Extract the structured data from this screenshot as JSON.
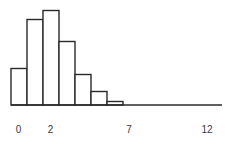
{
  "chart_data": {
    "type": "bar",
    "title": "",
    "subtitle": "",
    "xlabel": "",
    "ylabel": "",
    "grid": false,
    "legend": null,
    "bin_width": 1,
    "bin_edges": [
      0,
      1,
      2,
      3,
      4,
      5,
      6,
      7,
      12
    ],
    "categories": [
      "0-1",
      "1-2",
      "2-3",
      "3-4",
      "4-5",
      "5-6",
      "6-7"
    ],
    "values": [
      36,
      85,
      94,
      63,
      30,
      13,
      3
    ],
    "ylim": [
      0,
      100
    ],
    "xlim": [
      0,
      12
    ],
    "tick_labels": [
      "0",
      "2",
      "7",
      "12"
    ],
    "tick_values": [
      0,
      2,
      7,
      12
    ],
    "axis_color": "#2a2a2a",
    "bar_fill": "#ffffff",
    "bar_stroke": "#2a2a2a",
    "label_color": "#3a3a3a"
  },
  "axis": {
    "x0_label": "0",
    "x1_label": "2",
    "x2_label": "7",
    "x3_label": "12"
  },
  "bars": [
    {
      "name": "bar-0-1",
      "x": 11.0,
      "y": 68.5,
      "w": 16,
      "h": 36.5
    },
    {
      "name": "bar-1-2",
      "x": 27.0,
      "y": 19.5,
      "w": 16,
      "h": 85.5
    },
    {
      "name": "bar-2-3",
      "x": 43.0,
      "y": 10.5,
      "w": 16,
      "h": 94.5
    },
    {
      "name": "bar-3-4",
      "x": 59.0,
      "y": 41.5,
      "w": 16,
      "h": 63.5
    },
    {
      "name": "bar-4-5",
      "x": 75.0,
      "y": 74.5,
      "w": 16,
      "h": 30.5
    },
    {
      "name": "bar-5-6",
      "x": 91.0,
      "y": 91.5,
      "w": 16,
      "h": 13.5
    },
    {
      "name": "bar-6-7",
      "x": 107.0,
      "y": 101.5,
      "w": 16,
      "h": 3.5
    }
  ],
  "baseline": {
    "x1": 11,
    "x2": 222,
    "y": 105
  },
  "tick_positions": {
    "t0": 18.5,
    "t1": 50.5,
    "t2": 129,
    "t3": 207,
    "y": 133
  }
}
